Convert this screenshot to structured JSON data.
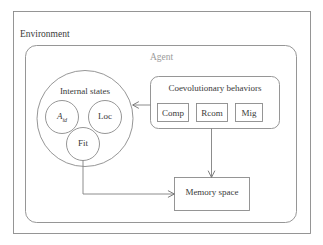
{
  "diagram": {
    "title_label": "Environment",
    "agent_label": "Agent",
    "internal_states": {
      "label": "Internal states",
      "nodes": [
        {
          "id": "aid",
          "label_main": "A",
          "label_sub": "id"
        },
        {
          "id": "loc",
          "label": "Loc"
        },
        {
          "id": "fit",
          "label": "Fit"
        }
      ]
    },
    "coevolutionary": {
      "label": "Coevolutionary behaviors",
      "items": [
        {
          "id": "comp",
          "label": "Comp"
        },
        {
          "id": "rcom",
          "label": "Rcom"
        },
        {
          "id": "mig",
          "label": "Mig"
        }
      ]
    },
    "memory": {
      "label": "Memory space"
    },
    "edges": [
      {
        "id": "behaviors-to-internal-states",
        "from": "coevolutionary",
        "to": "internal_states",
        "label": ""
      },
      {
        "id": "behaviors-to-memory",
        "from": "coevolutionary",
        "to": "memory",
        "label": ""
      },
      {
        "id": "internal-states-to-memory",
        "from": "internal_states",
        "to": "memory",
        "label": ""
      }
    ],
    "colors": {
      "stroke": "#8a8a8a",
      "arrow": "#7f7f7f",
      "text": "#3a3a3a",
      "agent_text": "#9b9b9b",
      "background": "#ffffff"
    }
  }
}
